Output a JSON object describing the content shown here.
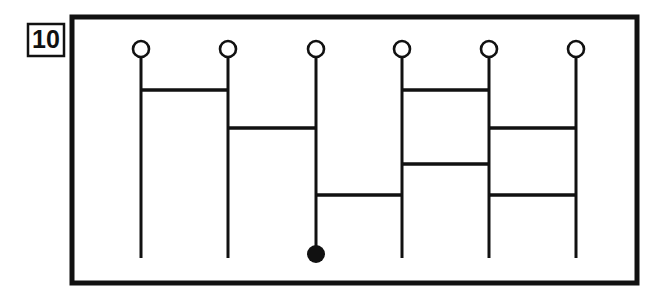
{
  "figure": {
    "label": "10",
    "type": "ladder-diagram",
    "colors": {
      "ink": "#111111",
      "background": "#ffffff",
      "marker_fill": "#111111",
      "circle_fill": "#ffffff"
    },
    "label_box": {
      "x": 28,
      "y": 24,
      "width": 36,
      "height": 32,
      "stroke_width": 2.5
    },
    "frame": {
      "x": 72,
      "y": 17,
      "width": 565,
      "height": 266,
      "stroke_width": 5
    },
    "strand_geometry": {
      "top_y": 58,
      "bottom_y": 258,
      "circle_cy": 49,
      "circle_r": 8,
      "circle_stroke_width": 2.6,
      "strand_stroke_width": 3,
      "rung_stroke_width": 3.4,
      "marker_r": 9
    },
    "strands": [
      {
        "id": 1,
        "x": 141,
        "top_node": "open-circle",
        "bottom_node": "none"
      },
      {
        "id": 2,
        "x": 228,
        "top_node": "open-circle",
        "bottom_node": "none"
      },
      {
        "id": 3,
        "x": 316,
        "top_node": "open-circle",
        "bottom_node": "filled-dot"
      },
      {
        "id": 4,
        "x": 402,
        "top_node": "open-circle",
        "bottom_node": "none"
      },
      {
        "id": 5,
        "x": 489,
        "top_node": "open-circle",
        "bottom_node": "none"
      },
      {
        "id": 6,
        "x": 576,
        "top_node": "open-circle",
        "bottom_node": "none"
      }
    ],
    "rungs": [
      {
        "id": "r1",
        "from_strand": 1,
        "to_strand": 2,
        "y": 90
      },
      {
        "id": "r2",
        "from_strand": 4,
        "to_strand": 5,
        "y": 90
      },
      {
        "id": "r3",
        "from_strand": 2,
        "to_strand": 3,
        "y": 128
      },
      {
        "id": "r4",
        "from_strand": 5,
        "to_strand": 6,
        "y": 128
      },
      {
        "id": "r5",
        "from_strand": 4,
        "to_strand": 5,
        "y": 164
      },
      {
        "id": "r6",
        "from_strand": 3,
        "to_strand": 4,
        "y": 195
      },
      {
        "id": "r7",
        "from_strand": 5,
        "to_strand": 6,
        "y": 195
      }
    ],
    "marker": {
      "strand": 3,
      "cx": 316,
      "cy": 254
    }
  }
}
